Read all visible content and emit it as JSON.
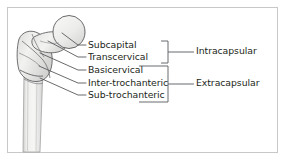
{
  "figure": {
    "anatomy_icon": "proximal-femur-icon",
    "border_color": "#c8c8c8",
    "text_color": "#231f20",
    "line_color": "#58595b",
    "bone_outline_color": "#58595b",
    "bone_fill_color": "#e8e8e6",
    "background": "#ffffff"
  },
  "fracture_levels": [
    {
      "id": "subcapital",
      "label": "Subcapital",
      "group": "Intracapsular"
    },
    {
      "id": "transcervical",
      "label": "Transcervical",
      "group": "Intracapsular"
    },
    {
      "id": "basicervical",
      "label": "Basicervical",
      "group": "Extracapsular"
    },
    {
      "id": "inter-trochanteric",
      "label": "Inter-trochanteric",
      "group": "Extracapsular"
    },
    {
      "id": "sub-trochanteric",
      "label": "Sub-trochanteric",
      "group": "Extracapsular"
    }
  ],
  "groups": [
    {
      "id": "intracapsular",
      "label": "Intracapsular",
      "spans": [
        "subcapital",
        "transcervical"
      ]
    },
    {
      "id": "extracapsular",
      "label": "Extracapsular",
      "spans": [
        "basicervical",
        "inter-trochanteric",
        "sub-trochanteric"
      ]
    }
  ]
}
